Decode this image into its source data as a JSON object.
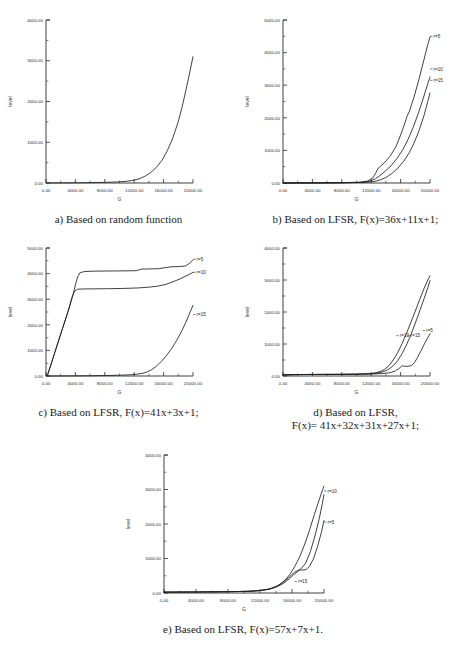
{
  "figure": {
    "axis_titles": {
      "x": "G",
      "y": "level"
    },
    "x_ticks": [
      "0.00",
      "4000.00",
      "8000.00",
      "12000.00",
      "16000.00",
      "20000.00"
    ],
    "y_ticks_4000": [
      "0.00",
      "1000.00",
      "2000.00",
      "3000.00",
      "4000.00"
    ],
    "y_ticks_5000": [
      "0.00",
      "1000.00",
      "2000.00",
      "3000.00",
      "4000.00",
      "5000.00"
    ],
    "captions": {
      "a": "a) Based on random function",
      "b": "b) Based on LFSR, F(x)=36x+11x+1;",
      "c": "c) Based on LFSR, F(x)=41x+3x+1;",
      "d": "d) Based on LFSR,\nF(x)= 41x+32x+31x+27x+1;",
      "e": "e) Based on LFSR, F(x)=57x+7x+1."
    }
  },
  "chart_data": [
    {
      "id": "a",
      "type": "line",
      "title": "a) Based on random function",
      "xlabel": "G",
      "ylabel": "level",
      "xlim": [
        0,
        20000
      ],
      "ylim": [
        0,
        4000
      ],
      "xtick_values": [
        0,
        4000,
        8000,
        12000,
        16000,
        20000
      ],
      "ytick_values": [
        0,
        1000,
        2000,
        3000,
        4000
      ],
      "grid": false,
      "legend_position": "inline-right",
      "series": [
        {
          "name": "",
          "x": [
            0,
            2000,
            4000,
            6000,
            8000,
            10000,
            11000,
            12000,
            12800,
            13500,
            14200,
            15000,
            15800,
            16500,
            17200,
            17900,
            18500,
            19100,
            19600,
            20000
          ],
          "values": [
            0,
            2,
            5,
            9,
            15,
            28,
            42,
            70,
            110,
            170,
            250,
            380,
            560,
            790,
            1080,
            1450,
            1850,
            2330,
            2750,
            3100
          ]
        }
      ]
    },
    {
      "id": "b",
      "type": "line",
      "title": "b) Based on LFSR, F(x)=36x+11x+1;",
      "xlabel": "G",
      "ylabel": "level",
      "xlim": [
        0,
        20000
      ],
      "ylim": [
        0,
        5000
      ],
      "xtick_values": [
        0,
        4000,
        8000,
        12000,
        16000,
        20000
      ],
      "ytick_values": [
        0,
        1000,
        2000,
        3000,
        4000,
        5000
      ],
      "grid": false,
      "legend_position": "inline-right",
      "series": [
        {
          "name": "r=5",
          "label_x": 20000,
          "label_y": 4500,
          "x": [
            0,
            4000,
            8000,
            10500,
            11500,
            12200,
            12600,
            12900,
            13000,
            13100,
            13800,
            14600,
            15400,
            16100,
            16600,
            16900,
            17200,
            17800,
            18500,
            19200,
            19700,
            20000
          ],
          "values": [
            0,
            3,
            10,
            25,
            60,
            150,
            300,
            430,
            470,
            480,
            620,
            830,
            1130,
            1530,
            1850,
            2060,
            2200,
            2620,
            3180,
            3800,
            4250,
            4480
          ]
        },
        {
          "name": "r=10",
          "label_x": 20000,
          "label_y": 3500,
          "x": [
            0,
            4000,
            8000,
            10500,
            11800,
            12600,
            13200,
            13900,
            14700,
            15500,
            16300,
            17000,
            17700,
            18400,
            19100,
            19700,
            20000
          ],
          "values": [
            0,
            2,
            8,
            20,
            55,
            130,
            230,
            360,
            530,
            750,
            1020,
            1330,
            1700,
            2130,
            2610,
            3050,
            3250
          ]
        },
        {
          "name": "r=15",
          "label_x": 20000,
          "label_y": 3150,
          "x": [
            0,
            4000,
            8000,
            11000,
            12400,
            13300,
            14000,
            14800,
            15600,
            16400,
            17100,
            17800,
            18500,
            19200,
            19700,
            20000
          ],
          "values": [
            0,
            2,
            6,
            18,
            45,
            100,
            170,
            290,
            450,
            660,
            900,
            1210,
            1600,
            2080,
            2500,
            2760
          ]
        }
      ]
    },
    {
      "id": "c",
      "type": "line",
      "title": "c) Based on LFSR, F(x)=41x+3x+1;",
      "xlabel": "G",
      "ylabel": "level",
      "xlim": [
        0,
        20000
      ],
      "ylim": [
        0,
        5000
      ],
      "xtick_values": [
        0,
        4000,
        8000,
        12000,
        16000,
        20000
      ],
      "ytick_values": [
        0,
        1000,
        2000,
        3000,
        4000,
        5000
      ],
      "grid": false,
      "legend_position": "inline-right",
      "series": [
        {
          "name": "r=5",
          "label_x": 20000,
          "label_y": 4560,
          "x": [
            200,
            800,
            1600,
            2400,
            3200,
            3700,
            4000,
            4300,
            4600,
            5200,
            6400,
            8000,
            10000,
            11500,
            12300,
            13000,
            14500,
            15400,
            16200,
            17000,
            18200,
            19000,
            19600,
            20000
          ],
          "values": [
            30,
            560,
            1280,
            1990,
            2700,
            3200,
            3560,
            3870,
            4030,
            4080,
            4095,
            4100,
            4105,
            4110,
            4115,
            4175,
            4185,
            4195,
            4230,
            4265,
            4275,
            4300,
            4420,
            4540
          ]
        },
        {
          "name": "r=10",
          "label_x": 20000,
          "label_y": 4050,
          "x": [
            200,
            800,
            1600,
            2400,
            3000,
            3300,
            3600,
            3900,
            4300,
            5000,
            6500,
            8500,
            10500,
            12500,
            14000,
            15200,
            16200,
            17000,
            17800,
            18500,
            19200,
            19700,
            20000
          ],
          "values": [
            30,
            560,
            1280,
            1990,
            2520,
            2830,
            3130,
            3320,
            3390,
            3400,
            3405,
            3410,
            3420,
            3440,
            3470,
            3510,
            3570,
            3650,
            3740,
            3830,
            3930,
            4000,
            4050
          ]
        },
        {
          "name": "r=15",
          "label_x": 20000,
          "label_y": 2400,
          "x": [
            0,
            2000,
            4000,
            6000,
            8000,
            10000,
            11500,
            12500,
            13200,
            13800,
            14400,
            15000,
            15700,
            16400,
            17100,
            17800,
            18400,
            19000,
            19500,
            20000
          ],
          "values": [
            0,
            2,
            5,
            10,
            18,
            30,
            48,
            75,
            110,
            165,
            250,
            380,
            570,
            800,
            1080,
            1400,
            1720,
            2080,
            2420,
            2760
          ]
        }
      ]
    },
    {
      "id": "d",
      "type": "line",
      "title": "d) Based on LFSR, F(x)= 41x+32x+31x+27x+1;",
      "xlabel": "G",
      "ylabel": "level",
      "xlim": [
        0,
        20000
      ],
      "ylim": [
        0,
        4000
      ],
      "xtick_values": [
        0,
        4000,
        8000,
        12000,
        16000,
        20000
      ],
      "ytick_values": [
        0,
        1000,
        2000,
        3000,
        4000
      ],
      "grid": false,
      "legend_position": "inline-right",
      "series": [
        {
          "name": "r=10",
          "label_x": 15400,
          "label_y": 1260,
          "x": [
            0,
            2000,
            4000,
            6000,
            8000,
            10000,
            11500,
            12500,
            13200,
            13800,
            14400,
            15000,
            15600,
            16200,
            16800,
            17400,
            18000,
            18600,
            19200,
            19700,
            20000
          ],
          "values": [
            35,
            45,
            48,
            50,
            52,
            58,
            70,
            95,
            135,
            205,
            320,
            500,
            730,
            1010,
            1330,
            1680,
            2030,
            2390,
            2740,
            3000,
            3130
          ]
        },
        {
          "name": "r=15",
          "label_x": 16900,
          "label_y": 1260,
          "x": [
            0,
            2000,
            4000,
            6000,
            8000,
            10000,
            11800,
            12800,
            13600,
            14300,
            15000,
            15600,
            16200,
            16800,
            17400,
            18000,
            18600,
            19200,
            19700,
            20000
          ],
          "values": [
            35,
            45,
            48,
            50,
            52,
            56,
            68,
            92,
            130,
            200,
            320,
            480,
            700,
            970,
            1290,
            1650,
            2030,
            2420,
            2760,
            2980
          ]
        },
        {
          "name": "r=5",
          "label_x": 19000,
          "label_y": 1420,
          "x": [
            0,
            2000,
            4000,
            6000,
            8000,
            10000,
            12000,
            13500,
            14600,
            15300,
            15800,
            16100,
            16300,
            16500,
            17000,
            17500,
            17900,
            18300,
            18800,
            19300,
            19700,
            20000
          ],
          "values": [
            35,
            45,
            48,
            50,
            52,
            56,
            62,
            75,
            105,
            160,
            240,
            300,
            320,
            305,
            300,
            330,
            420,
            580,
            800,
            1030,
            1200,
            1320
          ]
        }
      ]
    },
    {
      "id": "e",
      "type": "line",
      "title": "e) Based on LFSR, F(x)=57x+7x+1.",
      "xlabel": "G",
      "ylabel": "level",
      "xlim": [
        0,
        20000
      ],
      "ylim": [
        0,
        4000
      ],
      "xtick_values": [
        0,
        4000,
        8000,
        12000,
        16000,
        20000
      ],
      "ytick_values": [
        0,
        1000,
        2000,
        3000,
        4000
      ],
      "grid": false,
      "legend_position": "inline-right",
      "series": [
        {
          "name": "r=10",
          "label_x": 20000,
          "label_y": 2960,
          "x": [
            0,
            4000,
            8000,
            10500,
            12000,
            13000,
            13800,
            14500,
            15200,
            15800,
            16400,
            17000,
            17600,
            18200,
            18800,
            19400,
            19800,
            20000
          ],
          "values": [
            25,
            30,
            38,
            48,
            70,
            105,
            160,
            250,
            390,
            560,
            790,
            1070,
            1420,
            1830,
            2280,
            2700,
            2980,
            3100
          ]
        },
        {
          "name": "r=5",
          "label_x": 20000,
          "label_y": 2060,
          "x": [
            0,
            4000,
            8000,
            10500,
            12000,
            13200,
            14200,
            15000,
            15700,
            16300,
            16800,
            17200,
            17500,
            17800,
            18200,
            18700,
            19200,
            19700,
            20000
          ],
          "values": [
            25,
            30,
            38,
            48,
            72,
            120,
            210,
            330,
            470,
            600,
            660,
            670,
            665,
            680,
            780,
            1000,
            1350,
            1780,
            2100
          ]
        },
        {
          "name": "r=15",
          "label_x": 16300,
          "label_y": 330,
          "x": [
            0,
            4000,
            8000,
            10500,
            12000,
            13200,
            14200,
            15000,
            15700,
            16200,
            16600,
            17100,
            17700,
            18300,
            18900,
            19400,
            19800,
            20000
          ],
          "values": [
            25,
            30,
            38,
            48,
            70,
            110,
            185,
            290,
            420,
            530,
            600,
            700,
            860,
            1200,
            1680,
            2150,
            2600,
            2850
          ]
        }
      ]
    }
  ]
}
